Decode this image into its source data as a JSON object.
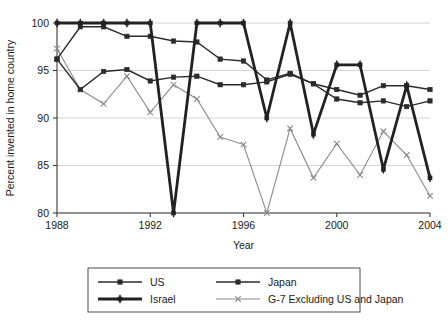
{
  "chart_data": {
    "type": "line",
    "title": "",
    "xlabel": "Year",
    "ylabel": "Percent invented in home country",
    "x": [
      1988,
      1989,
      1990,
      1991,
      1992,
      1993,
      1994,
      1995,
      1996,
      1997,
      1998,
      1999,
      2000,
      2001,
      2002,
      2003,
      2004
    ],
    "xlim": [
      1988,
      2004
    ],
    "ylim": [
      80,
      100
    ],
    "xticks": [
      1988,
      1992,
      1996,
      2000,
      2004
    ],
    "xtick_labels": [
      "1988",
      "1992",
      "1996",
      "2000",
      "2004"
    ],
    "yticks": [
      80,
      85,
      90,
      95,
      100
    ],
    "ytick_labels": [
      "80",
      "85",
      "90",
      "95",
      "100"
    ],
    "grid": "horizontal",
    "legend_position": "below",
    "series": [
      {
        "name": "US",
        "color": "#2b2b2b",
        "marker": "square",
        "line_width": 1.4,
        "values": [
          96.2,
          99.6,
          99.6,
          98.6,
          98.6,
          98.1,
          98.0,
          96.2,
          96.0,
          94.0,
          94.7,
          93.6,
          93.0,
          92.4,
          93.4,
          93.4,
          93.0
        ]
      },
      {
        "name": "Japan",
        "color": "#2b2b2b",
        "marker": "square",
        "line_width": 1.4,
        "values": [
          96.2,
          93.0,
          94.9,
          95.1,
          93.9,
          94.3,
          94.4,
          93.5,
          93.5,
          93.8,
          94.6,
          93.6,
          92.0,
          91.6,
          91.8,
          91.2,
          91.8
        ]
      },
      {
        "name": "Israel",
        "color": "#222222",
        "marker": "plus-square",
        "line_width": 2.8,
        "values": [
          100.0,
          100.0,
          100.0,
          100.0,
          100.0,
          80.0,
          100.0,
          100.0,
          100.0,
          90.0,
          100.0,
          88.3,
          95.6,
          95.6,
          84.6,
          93.4,
          83.7
        ]
      },
      {
        "name": "G-7 Excluding US and Japan",
        "color": "#8a8a8a",
        "marker": "x",
        "line_width": 1.1,
        "values": [
          97.3,
          93.0,
          91.5,
          94.4,
          90.6,
          93.5,
          92.0,
          88.0,
          87.2,
          80.0,
          88.9,
          83.7,
          87.3,
          84.0,
          88.6,
          86.1,
          81.8
        ]
      }
    ],
    "legend_entries": [
      {
        "name": "US",
        "color": "#2b2b2b",
        "marker": "square",
        "line_width": 1.4
      },
      {
        "name": "Japan",
        "color": "#2b2b2b",
        "marker": "square",
        "line_width": 1.4
      },
      {
        "name": "Israel",
        "color": "#222222",
        "marker": "plus-square",
        "line_width": 2.8
      },
      {
        "name": "G-7 Excluding US and Japan",
        "color": "#8a8a8a",
        "marker": "x",
        "line_width": 1.1
      }
    ]
  },
  "plot_geometry": {
    "left": 57,
    "right": 430,
    "top": 23,
    "bottom": 213,
    "legend": {
      "left": 88,
      "top": 268,
      "width": 272,
      "height": 44
    }
  }
}
